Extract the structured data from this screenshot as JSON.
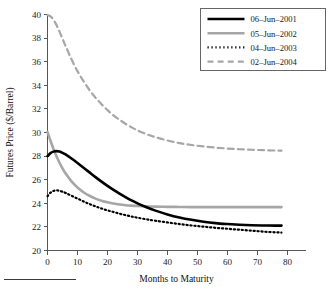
{
  "chart_data": {
    "type": "line",
    "title": "",
    "xlabel": "Months to Maturity",
    "ylabel": "Futures Price ($/Barrel)",
    "xlim": [
      0,
      80
    ],
    "ylim": [
      20,
      40
    ],
    "xticks": [
      0,
      10,
      20,
      30,
      40,
      50,
      60,
      70,
      80
    ],
    "xticklabels": [
      "0",
      "10",
      "20",
      "30",
      "40",
      "50",
      "60",
      "70",
      "80"
    ],
    "yticks": [
      20,
      22,
      24,
      26,
      28,
      30,
      32,
      34,
      36,
      38,
      40
    ],
    "yticklabels": [
      "20",
      "22",
      "24",
      "26",
      "28",
      "30",
      "32",
      "34",
      "36",
      "38",
      "40"
    ],
    "grid": false,
    "legend_position": "top-right",
    "legend_boxed": true,
    "series": [
      {
        "name": "06-Jun-2001",
        "label": "06–Jun–2001",
        "style": "solid",
        "color": "#000000",
        "width": 2.6,
        "x": [
          0,
          1,
          2,
          3,
          4,
          5,
          6,
          8,
          10,
          12,
          14,
          16,
          18,
          20,
          22,
          24,
          26,
          28,
          30,
          33,
          36,
          40,
          44,
          48,
          52,
          56,
          60,
          64,
          68,
          72,
          76,
          78
        ],
        "y": [
          28.0,
          28.25,
          28.38,
          28.42,
          28.38,
          28.28,
          28.14,
          27.8,
          27.42,
          27.02,
          26.62,
          26.22,
          25.84,
          25.48,
          25.14,
          24.82,
          24.52,
          24.24,
          23.99,
          23.66,
          23.38,
          23.06,
          22.8,
          22.6,
          22.44,
          22.32,
          22.24,
          22.18,
          22.14,
          22.12,
          22.11,
          22.11
        ]
      },
      {
        "name": "05-Jun-2002",
        "label": "05–Jun–2002",
        "style": "solid",
        "color": "#a6a6a6",
        "width": 2.6,
        "x": [
          0,
          1,
          2,
          3,
          4,
          5,
          6,
          8,
          10,
          12,
          14,
          16,
          18,
          20,
          22,
          24,
          26,
          28,
          30,
          33,
          36,
          40,
          44,
          48,
          52,
          56,
          60,
          64,
          68,
          72,
          76,
          78
        ],
        "y": [
          30.05,
          29.3,
          28.6,
          27.98,
          27.44,
          26.96,
          26.54,
          25.86,
          25.34,
          24.94,
          24.64,
          24.4,
          24.22,
          24.08,
          23.98,
          23.9,
          23.84,
          23.8,
          23.77,
          23.74,
          23.72,
          23.7,
          23.69,
          23.68,
          23.68,
          23.68,
          23.68,
          23.68,
          23.68,
          23.68,
          23.68,
          23.68
        ]
      },
      {
        "name": "04-Jun-2003",
        "label": "04–Jun–2003",
        "style": "dotted",
        "color": "#000000",
        "width": 2.2,
        "x": [
          0,
          1,
          2,
          3,
          4,
          5,
          6,
          8,
          10,
          12,
          14,
          16,
          18,
          20,
          22,
          24,
          26,
          28,
          30,
          33,
          36,
          40,
          44,
          48,
          52,
          56,
          60,
          64,
          68,
          72,
          76,
          78
        ],
        "y": [
          24.6,
          24.9,
          25.05,
          25.1,
          25.06,
          24.98,
          24.88,
          24.64,
          24.4,
          24.16,
          23.94,
          23.74,
          23.56,
          23.4,
          23.26,
          23.12,
          23.0,
          22.88,
          22.78,
          22.64,
          22.52,
          22.38,
          22.24,
          22.12,
          22.02,
          21.92,
          21.84,
          21.76,
          21.68,
          21.6,
          21.54,
          21.52
        ]
      },
      {
        "name": "02-Jun-2004",
        "label": "02–Jun–2004",
        "style": "dashed",
        "color": "#a6a6a6",
        "width": 2.2,
        "x": [
          0,
          1,
          2,
          3,
          4,
          5,
          6,
          8,
          10,
          12,
          14,
          16,
          18,
          20,
          22,
          24,
          26,
          28,
          30,
          33,
          36,
          40,
          44,
          48,
          52,
          56,
          60,
          64,
          68,
          72,
          76,
          78
        ],
        "y": [
          39.95,
          39.85,
          39.55,
          39.1,
          38.55,
          37.95,
          37.35,
          36.2,
          35.2,
          34.35,
          33.6,
          32.95,
          32.4,
          31.9,
          31.45,
          31.08,
          30.74,
          30.44,
          30.18,
          29.86,
          29.6,
          29.32,
          29.1,
          28.94,
          28.82,
          28.72,
          28.64,
          28.58,
          28.54,
          28.5,
          28.47,
          28.46
        ]
      }
    ]
  }
}
